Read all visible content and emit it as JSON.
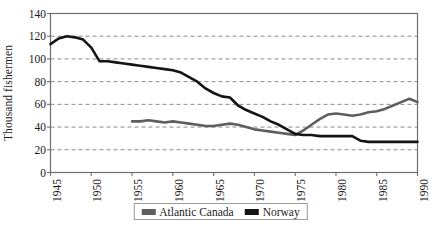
{
  "chart_data": {
    "type": "line",
    "title": "",
    "xlabel": "",
    "ylabel": "Thousand fishermen",
    "xlim": [
      1945,
      1990
    ],
    "ylim": [
      0,
      140
    ],
    "yticks": [
      0,
      20,
      40,
      60,
      80,
      100,
      120,
      140
    ],
    "xticks": [
      1945,
      1950,
      1955,
      1960,
      1965,
      1970,
      1975,
      1980,
      1985,
      1990
    ],
    "grid": "horizontal-dashed",
    "legend_position": "bottom-center",
    "series": [
      {
        "name": "Atlantic Canada",
        "color": "#5e5e5e",
        "x": [
          1955,
          1956,
          1957,
          1958,
          1959,
          1960,
          1961,
          1962,
          1963,
          1964,
          1965,
          1966,
          1967,
          1968,
          1969,
          1970,
          1971,
          1972,
          1973,
          1974,
          1975,
          1976,
          1977,
          1978,
          1979,
          1980,
          1981,
          1982,
          1983,
          1984,
          1985,
          1986,
          1987,
          1988,
          1989,
          1990
        ],
        "values": [
          45,
          45,
          46,
          45,
          44,
          45,
          44,
          43,
          42,
          41,
          41,
          42,
          43,
          42,
          40,
          38,
          37,
          36,
          35,
          34,
          33,
          37,
          42,
          47,
          51,
          52,
          51,
          50,
          51,
          53,
          54,
          56,
          59,
          62,
          65,
          62
        ]
      },
      {
        "name": "Norway",
        "color": "#141414",
        "x": [
          1945,
          1946,
          1947,
          1948,
          1949,
          1950,
          1951,
          1952,
          1953,
          1954,
          1955,
          1956,
          1957,
          1958,
          1959,
          1960,
          1961,
          1962,
          1963,
          1964,
          1965,
          1966,
          1967,
          1968,
          1969,
          1970,
          1971,
          1972,
          1973,
          1974,
          1975,
          1976,
          1977,
          1978,
          1979,
          1980,
          1981,
          1982,
          1983,
          1984,
          1985,
          1986,
          1987,
          1988,
          1989,
          1990
        ],
        "values": [
          113,
          118,
          120,
          119,
          117,
          110,
          98,
          98,
          97,
          96,
          95,
          94,
          93,
          92,
          91,
          90,
          88,
          84,
          80,
          74,
          70,
          67,
          66,
          59,
          55,
          52,
          49,
          45,
          42,
          38,
          34,
          33,
          33,
          32,
          32,
          32,
          32,
          32,
          28,
          27,
          27,
          27,
          27,
          27,
          27,
          27
        ]
      }
    ]
  },
  "legend": {
    "items": [
      {
        "label": "Atlantic Canada",
        "color": "#5e5e5e"
      },
      {
        "label": "Norway",
        "color": "#141414"
      }
    ]
  }
}
